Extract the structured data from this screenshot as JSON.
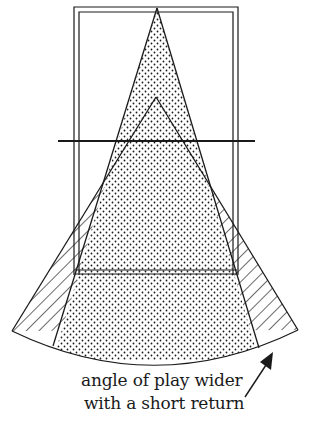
{
  "diagram": {
    "colors": {
      "ink": "#1a1a1a",
      "background": "#ffffff"
    },
    "shapes": {
      "court_outline": "double-line rectangle (half court)",
      "net_line": "horizontal line across court",
      "service_line": "horizontal double line",
      "narrow_angle": "stippled triangle from far baseline (deep return)",
      "wide_angle": "triangle from near net (short return)",
      "wider_area": "hatched wedges showing extra coverage"
    },
    "caption": {
      "line1": "angle of play wider",
      "line2": "with a short return"
    },
    "arrow": "pointer arrow to hatched region"
  }
}
